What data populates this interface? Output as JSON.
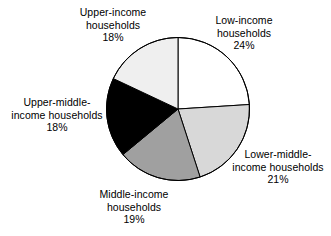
{
  "chart_data": {
    "type": "pie",
    "title": "",
    "subtitle": "",
    "xlabel": "",
    "ylabel": "",
    "legend_position": "none",
    "grid": false,
    "units": "percent",
    "start_angle_deg": 0,
    "direction": "clockwise",
    "categories": [
      "Low-income households",
      "Lower-middle-income households",
      "Middle-income households",
      "Upper-middle-income households",
      "Upper-income households"
    ],
    "values": [
      24,
      21,
      19,
      18,
      18
    ],
    "labels": [
      "24%",
      "21%",
      "19%",
      "18%",
      "18%"
    ],
    "colors": [
      "#ffffff",
      "#d8d8d8",
      "#a0a0a0",
      "#000000",
      "#efefef"
    ],
    "slice_border_color": "#000000",
    "slices": [
      {
        "name": "Low-income households",
        "value": 24,
        "label": "24%",
        "color": "#ffffff",
        "start_deg": 0,
        "end_deg": 86.4
      },
      {
        "name": "Lower-middle-income households",
        "value": 21,
        "label": "21%",
        "color": "#d8d8d8",
        "start_deg": 86.4,
        "end_deg": 162.0
      },
      {
        "name": "Middle-income households",
        "value": 19,
        "label": "19%",
        "color": "#a0a0a0",
        "start_deg": 162.0,
        "end_deg": 230.4
      },
      {
        "name": "Upper-middle-income households",
        "value": 18,
        "label": "18%",
        "color": "#000000",
        "start_deg": 230.4,
        "end_deg": 295.2
      },
      {
        "name": "Upper-income households",
        "value": 18,
        "label": "18%",
        "color": "#efefef",
        "start_deg": 295.2,
        "end_deg": 360.0
      }
    ]
  },
  "labels": {
    "upper_income": {
      "line1": "Upper-income",
      "line2": "households",
      "percent": "18%"
    },
    "low_income": {
      "line1": "Low-income",
      "line2": "households",
      "percent": "24%"
    },
    "upper_middle_income": {
      "line1": "Upper-middle-",
      "line2": "income households",
      "percent": "18%"
    },
    "lower_middle_income": {
      "line1": "Lower-middle-",
      "line2": "income households",
      "percent": "21%"
    },
    "middle_income": {
      "line1": "Middle-income",
      "line2": "households",
      "percent": "19%"
    }
  }
}
